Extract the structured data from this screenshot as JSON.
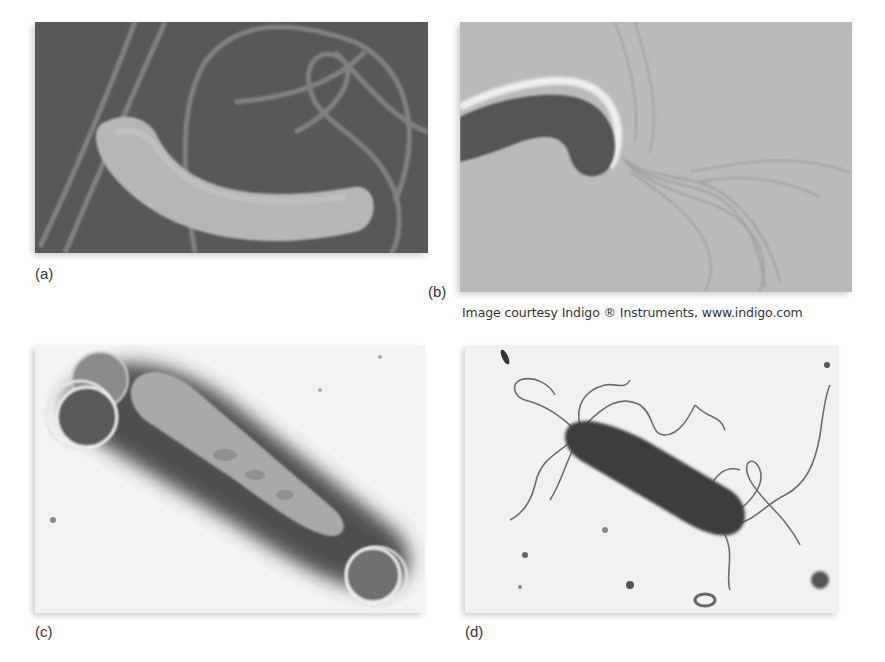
{
  "figure": {
    "panels": [
      {
        "id": "a",
        "label": "(a)",
        "description": "SEM micrograph of curved rod bacterium with flagella",
        "background": "#4b4b4b"
      },
      {
        "id": "b",
        "label": "(b)",
        "description": "Phase-contrast micrograph of curved bacterium with tuft of flagella",
        "background": "#b9b9b9"
      },
      {
        "id": "c",
        "label": "(c)",
        "description": "TEM micrograph of rod bacterium with dark halo and ring structures at poles",
        "background": "#f2f2f2"
      },
      {
        "id": "d",
        "label": "(d)",
        "description": "TEM micrograph of dark rod bacterium with many wavy flagella",
        "background": "#f0f0f0"
      }
    ],
    "credit": "Image courtesy Indigo ® Instruments, www.indigo.com"
  }
}
